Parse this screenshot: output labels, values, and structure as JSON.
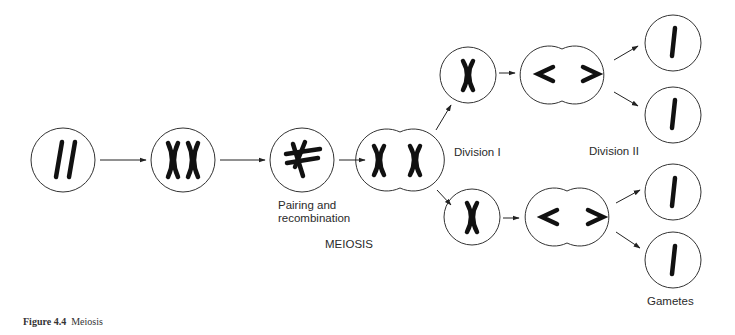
{
  "figure": {
    "caption_number": "Figure 4.4",
    "caption_title": "Meiosis",
    "main_label": "MEIOSIS"
  },
  "labels": {
    "pairing": "Pairing and\nrecombination",
    "division_1": "Division I",
    "division_2": "Division II",
    "gametes": "Gametes"
  },
  "colors": {
    "stroke": "#333333",
    "chromosome": "#111111",
    "background": "#ffffff"
  },
  "stages": [
    {
      "id": "diploid-cell",
      "chromosomes": "II"
    },
    {
      "id": "replicated-cell",
      "chromosomes": "XX"
    },
    {
      "id": "pairing-cell",
      "chromosomes": "crossed pair"
    },
    {
      "id": "dividing-cell-1",
      "chromosomes": "X X"
    },
    {
      "id": "division1-upper",
      "chromosomes": "X"
    },
    {
      "id": "division1-lower",
      "chromosomes": "X"
    },
    {
      "id": "division2-upper",
      "chromosomes": "< >"
    },
    {
      "id": "division2-lower",
      "chromosomes": "< >"
    },
    {
      "id": "gamete-1",
      "chromosomes": "I"
    },
    {
      "id": "gamete-2",
      "chromosomes": "I"
    },
    {
      "id": "gamete-3",
      "chromosomes": "I"
    },
    {
      "id": "gamete-4",
      "chromosomes": "I"
    }
  ]
}
